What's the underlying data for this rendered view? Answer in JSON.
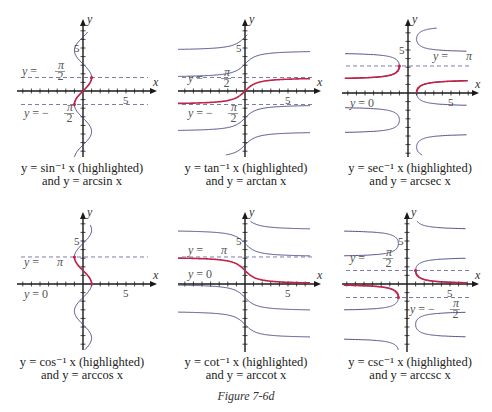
{
  "figure_caption": "Figure 7-6d",
  "colors": {
    "highlight": "#c0244a",
    "curve": "#3d3f7e",
    "axis": "#1a1a1a",
    "dash": "#5a5a9a"
  },
  "panels": [
    {
      "id": "arcsin",
      "caption_line1": "y = sin⁻¹ x (highlighted)",
      "caption_line2": "and y = arcsin x",
      "axis_x_label": "x",
      "axis_y_label": "y",
      "tick5_x": "5",
      "tick5_y": "5",
      "asymptote_labels": [
        "y = π/2",
        "y = −π/2"
      ]
    },
    {
      "id": "arctan",
      "caption_line1": "y = tan⁻¹ x (highlighted)",
      "caption_line2": "and y = arctan x",
      "axis_x_label": "x",
      "axis_y_label": "y",
      "tick5_x": "5",
      "tick5_y": "5",
      "asymptote_labels": [
        "y = π/2",
        "y = −π/2"
      ]
    },
    {
      "id": "arcsec",
      "caption_line1": "y = sec⁻¹ x (highlighted)",
      "caption_line2": "and y = arcsec x",
      "axis_x_label": "x",
      "axis_y_label": "y",
      "tick5_x": "5",
      "tick5_y": "5",
      "asymptote_labels": [
        "y = π",
        "y = 0"
      ]
    },
    {
      "id": "arccos",
      "caption_line1": "y = cos⁻¹ x (highlighted)",
      "caption_line2": "and y = arccos x",
      "axis_x_label": "x",
      "axis_y_label": "y",
      "tick5_x": "5",
      "tick5_y": "5",
      "asymptote_labels": [
        "y = π",
        "y = 0"
      ]
    },
    {
      "id": "arccot",
      "caption_line1": "y = cot⁻¹ x (highlighted)",
      "caption_line2": "and y = arccot x",
      "axis_x_label": "x",
      "axis_y_label": "y",
      "tick5_x": "5",
      "tick5_y": "5",
      "asymptote_labels": [
        "y = π",
        "y = 0"
      ]
    },
    {
      "id": "arccsc",
      "caption_line1": "y = csc⁻¹ x (highlighted)",
      "caption_line2": "and y = arccsc x",
      "axis_x_label": "x",
      "axis_y_label": "y",
      "tick5_x": "5",
      "tick5_y": "5",
      "asymptote_labels": [
        "y = π/2",
        "y = −π/2"
      ]
    }
  ]
}
